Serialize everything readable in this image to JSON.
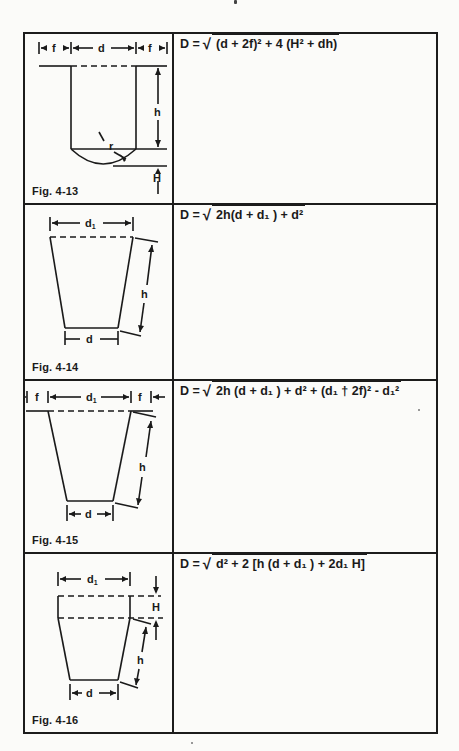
{
  "page": {
    "background": "#fbfbf9",
    "line_color": "#1c1c1c"
  },
  "rows": [
    {
      "figure": {
        "label": "Fig. 4-13",
        "dimensions": [
          "f",
          "d",
          "f",
          "h",
          "r",
          "H"
        ]
      },
      "formula": {
        "lhs": "D =",
        "radical": "√",
        "radicand": "(d + 2f)² + 4 (H² + dh)"
      }
    },
    {
      "figure": {
        "label": "Fig. 4-14",
        "dimensions": [
          "d₁",
          "h",
          "d"
        ]
      },
      "formula": {
        "lhs": "D =",
        "radical": "√",
        "radicand": "2h(d + d₁ ) + d²"
      }
    },
    {
      "figure": {
        "label": "Fig. 4-15",
        "dimensions": [
          "f",
          "d₁",
          "f",
          "h",
          "d"
        ]
      },
      "formula": {
        "lhs": "D =",
        "radical": "√",
        "radicand": "2h (d + d₁ ) + d² + (d₁ † 2f)² - d₁²"
      }
    },
    {
      "figure": {
        "label": "Fig. 4-16",
        "dimensions": [
          "d₁",
          "H",
          "h",
          "d"
        ]
      },
      "formula": {
        "lhs": "D =",
        "radical": "√",
        "radicand": "d² + 2 [h (d + d₁ ) + 2d₁ H]"
      }
    }
  ]
}
